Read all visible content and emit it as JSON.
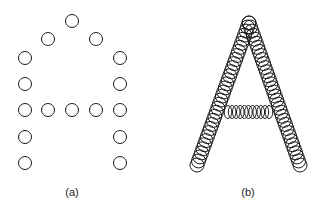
{
  "panels": [
    {
      "label": "(a)",
      "description": "Letter A represented by sparse discrete circles",
      "label_pos": [
        72,
        186
      ],
      "radius": 6.5,
      "circles": [
        [
          72,
          21
        ],
        [
          48,
          39
        ],
        [
          96,
          39
        ],
        [
          25,
          58
        ],
        [
          120,
          58
        ],
        [
          25,
          84
        ],
        [
          120,
          84
        ],
        [
          25,
          110
        ],
        [
          48,
          110
        ],
        [
          72,
          110
        ],
        [
          96,
          110
        ],
        [
          120,
          110
        ],
        [
          25,
          137
        ],
        [
          120,
          137
        ],
        [
          25,
          163
        ],
        [
          120,
          163
        ]
      ]
    },
    {
      "label": "(b)",
      "description": "Letter A represented by densely overlapping circles",
      "label_pos": [
        248,
        186
      ],
      "radius": 7,
      "apex": [
        249,
        23
      ],
      "left_foot": [
        197,
        165
      ],
      "right_foot": [
        300,
        165
      ],
      "leg_count": 36,
      "crossbar": {
        "x_start": 228,
        "x_end": 269,
        "y": 112,
        "count": 11,
        "rx": 2.8,
        "ry": 6.5
      }
    }
  ],
  "colors": {
    "stroke": "#1a1a1a",
    "background": "#ffffff"
  }
}
